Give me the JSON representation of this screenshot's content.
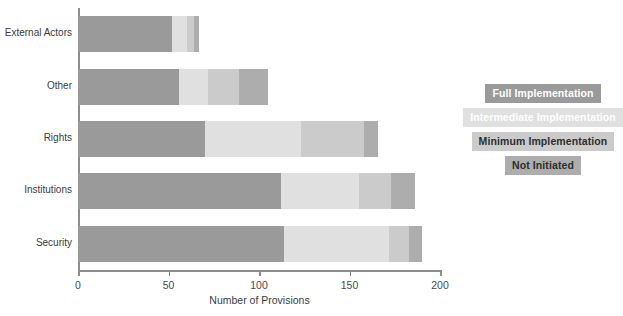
{
  "chart_data": {
    "type": "bar",
    "orientation": "horizontal",
    "stacked": true,
    "title": "",
    "xlabel": "Number of Provisions",
    "ylabel": "",
    "xlim": [
      0,
      200
    ],
    "xticks": [
      0,
      50,
      100,
      150,
      200
    ],
    "xtick_labels": [
      "0",
      "50",
      "100",
      "150",
      "200"
    ],
    "grid": false,
    "legend_position": "right",
    "categories": [
      "External Actors",
      "Other",
      "Rights",
      "Institutions",
      "Security"
    ],
    "series": [
      {
        "name": "Full Implementation",
        "color": "#9a9a9a",
        "values": [
          52,
          56,
          70,
          112,
          114
        ]
      },
      {
        "name": "Intermediate Implementation",
        "color": "#e0e0e0",
        "values": [
          8,
          16,
          53,
          43,
          58
        ]
      },
      {
        "name": "Minimum Implementation",
        "color": "#cbcbcb",
        "values": [
          4,
          17,
          35,
          18,
          11
        ]
      },
      {
        "name": "Not Initiated",
        "color": "#adadad",
        "values": [
          3,
          16,
          8,
          13,
          7
        ]
      }
    ],
    "totals": [
      67,
      105,
      166,
      186,
      190
    ]
  },
  "legend": {
    "items": [
      {
        "label": "Full Implementation",
        "bg": "#9a9a9a",
        "fg": "#ffffff"
      },
      {
        "label": "Intermediate Implementation",
        "bg": "#e0e0e0",
        "fg": "#ffffff"
      },
      {
        "label": "Minimum Implementation",
        "bg": "#cbcbcb",
        "fg": "#2e2e2e"
      },
      {
        "label": "Not Initiated",
        "bg": "#adadad",
        "fg": "#2e2e2e"
      }
    ]
  },
  "axis": {
    "x_title": "Number of Provisions",
    "tick_labels": [
      "0",
      "50",
      "100",
      "150",
      "200"
    ]
  }
}
